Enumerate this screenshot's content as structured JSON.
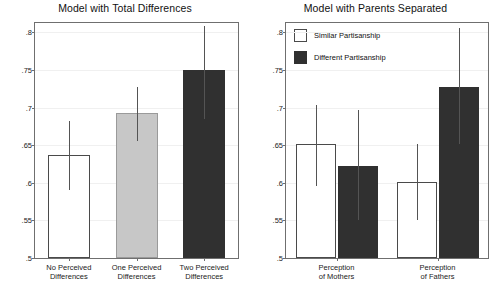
{
  "figure": {
    "ylabel": "Predicted Depressive Symptoms",
    "yticks": [
      ".5",
      ".55",
      ".6",
      ".65",
      ".7",
      ".75",
      ".8"
    ],
    "ylim": [
      0.5,
      0.8125
    ],
    "colors": {
      "open": "#ffffff",
      "gray": "#c7c7c7",
      "dark": "#303030",
      "axis": "#6f6f6f",
      "error": "#545454"
    }
  },
  "panels": [
    {
      "id": "total-differences",
      "title": "Model with Total Differences",
      "ylabel": "Predicted Depressive Symptoms",
      "legend": null
    },
    {
      "id": "parents-separated",
      "title": "Model with Parents Separated",
      "ylabel": "Predicted Depressive Symptoms",
      "legend": {
        "items": [
          {
            "label": "Similar Partisanship",
            "style": "open"
          },
          {
            "label": "Different Partisanship",
            "style": "dark"
          }
        ]
      }
    }
  ],
  "chart_data": [
    {
      "type": "bar",
      "title": "Model with Total Differences",
      "xlabel": "",
      "ylabel": "Predicted Depressive Symptoms",
      "ylim": [
        0.5,
        0.8125
      ],
      "yticks": [
        0.5,
        0.55,
        0.6,
        0.65,
        0.7,
        0.75,
        0.8
      ],
      "grid": true,
      "legend": "none",
      "categories": [
        "No Perceived Differences",
        "One Perceived Differences",
        "Two Perceived Differences"
      ],
      "category_lines": [
        [
          "No Perceived",
          "Differences"
        ],
        [
          "One Perceived",
          "Differences"
        ],
        [
          "Two Perceived",
          "Differences"
        ]
      ],
      "values": [
        0.637,
        0.693,
        0.75
      ],
      "errors_low": [
        0.591,
        0.655,
        0.685
      ],
      "errors_high": [
        0.682,
        0.728,
        0.808
      ],
      "bar_styles": [
        "open",
        "gray",
        "dark"
      ]
    },
    {
      "type": "bar",
      "title": "Model with Parents Separated",
      "xlabel": "",
      "ylabel": "Predicted Depressive Symptoms",
      "ylim": [
        0.5,
        0.8125
      ],
      "yticks": [
        0.5,
        0.55,
        0.6,
        0.65,
        0.7,
        0.75,
        0.8
      ],
      "grid": true,
      "legend": "top-left",
      "categories": [
        "Perception of Mothers",
        "Perception of Fathers"
      ],
      "category_lines": [
        [
          "Perception",
          "of Mothers"
        ],
        [
          "Perception",
          "of Fathers"
        ]
      ],
      "series": [
        {
          "name": "Similar Partisanship",
          "style": "open",
          "values": [
            0.651,
            0.601
          ],
          "errors_low": [
            0.596,
            0.551
          ],
          "errors_high": [
            0.704,
            0.652
          ]
        },
        {
          "name": "Different Partisanship",
          "style": "dark",
          "values": [
            0.622,
            0.727
          ],
          "errors_low": [
            0.55,
            0.651
          ],
          "errors_high": [
            0.697,
            0.806
          ]
        }
      ]
    }
  ]
}
